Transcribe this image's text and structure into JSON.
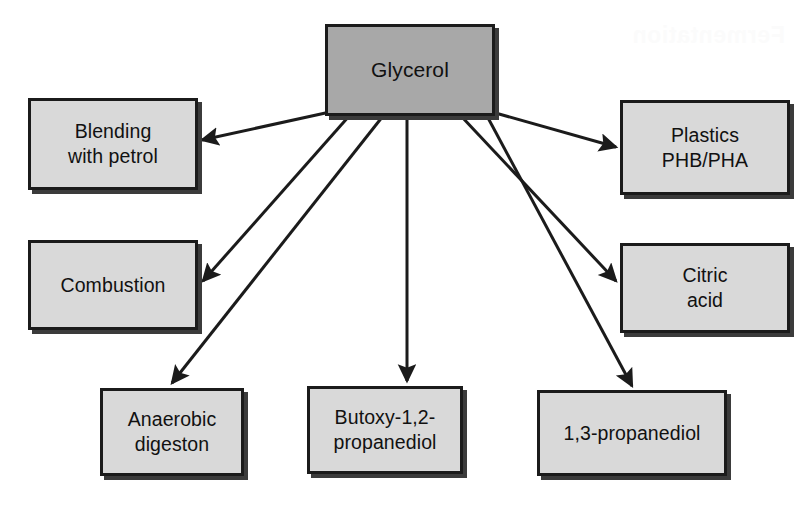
{
  "diagram": {
    "type": "flow-diagram",
    "background_color": "#ffffff",
    "central_fill": "#a8a8a8",
    "leaf_fill": "#d9d9d9",
    "border_color": "#1b1b1b",
    "arrow_color": "#1b1b1b",
    "central": {
      "id": "glycerol",
      "label": "Glycerol",
      "x": 325,
      "y": 24,
      "w": 170,
      "h": 92
    },
    "nodes": [
      {
        "id": "blending-with-petrol",
        "label": "Blending\nwith petrol",
        "x": 28,
        "y": 98,
        "w": 170,
        "h": 92
      },
      {
        "id": "plastics-phb-pha",
        "label": "Plastics\nPHB/PHA",
        "x": 620,
        "y": 100,
        "w": 170,
        "h": 95
      },
      {
        "id": "combustion",
        "label": "Combustion",
        "x": 28,
        "y": 240,
        "w": 170,
        "h": 90
      },
      {
        "id": "citric-acid",
        "label": "Citric\nacid",
        "x": 620,
        "y": 243,
        "w": 170,
        "h": 90
      },
      {
        "id": "anaerobic-digeston",
        "label": "Anaerobic\ndigeston",
        "x": 100,
        "y": 388,
        "w": 144,
        "h": 88
      },
      {
        "id": "butoxy-1-2-propanediol",
        "label": "Butoxy-1,2-\npropanediol",
        "x": 307,
        "y": 386,
        "w": 156,
        "h": 88
      },
      {
        "id": "1-3-propanediol",
        "label": "1,3-propanediol",
        "x": 537,
        "y": 390,
        "w": 190,
        "h": 86
      }
    ],
    "edges": [
      {
        "id": "edge-glycerol-to-blending",
        "from": "glycerol",
        "to": "blending-with-petrol",
        "x1": 330,
        "y1": 112,
        "x2": 202,
        "y2": 140
      },
      {
        "id": "edge-glycerol-to-combustion",
        "from": "glycerol",
        "to": "combustion",
        "x1": 350,
        "y1": 115,
        "x2": 203,
        "y2": 281
      },
      {
        "id": "edge-glycerol-to-anaerobic",
        "from": "glycerol",
        "to": "anaerobic-digeston",
        "x1": 383,
        "y1": 116,
        "x2": 172,
        "y2": 383
      },
      {
        "id": "edge-glycerol-to-butoxy",
        "from": "glycerol",
        "to": "butoxy-1-2-propanediol",
        "x1": 407,
        "y1": 116,
        "x2": 407,
        "y2": 381
      },
      {
        "id": "edge-glycerol-to-citric",
        "from": "glycerol",
        "to": "citric-acid",
        "x1": 461,
        "y1": 116,
        "x2": 616,
        "y2": 281
      },
      {
        "id": "edge-glycerol-to-plastics",
        "from": "glycerol",
        "to": "plastics-phb-pha",
        "x1": 492,
        "y1": 112,
        "x2": 616,
        "y2": 147
      },
      {
        "id": "edge-glycerol-to-13propanediol",
        "from": "glycerol",
        "to": "1-3-propanediol",
        "x1": 487,
        "y1": 116,
        "x2": 632,
        "y2": 386
      }
    ],
    "artifact": {
      "id": "scan-bleedthrough",
      "text": "Fermentation",
      "x": 632,
      "y": 22
    }
  }
}
